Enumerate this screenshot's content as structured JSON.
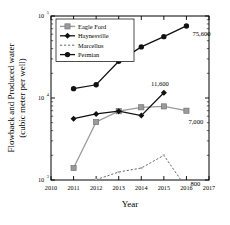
{
  "chart_data": {
    "type": "line",
    "title": "",
    "xlabel": "Year",
    "ylabel": "Flowback and Produced water (cubic meter per well)",
    "ylabel_line1": "Flowback and Produced water",
    "ylabel_line2": "(cubic meter per well)",
    "yscale": "log",
    "ylim": [
      1000,
      100000
    ],
    "ytick_labels": [
      "10",
      "10",
      "10"
    ],
    "ytick_exponents": [
      "5",
      "4",
      "3"
    ],
    "ytick_values": [
      100000,
      10000,
      1000
    ],
    "xlim": [
      2010,
      2017
    ],
    "xtick_labels": [
      "2010",
      "2011",
      "2012",
      "2013",
      "2014",
      "2015",
      "2016",
      "2017"
    ],
    "grid": false,
    "legend_position": "top-left",
    "x": [
      2011,
      2012,
      2013,
      2014,
      2015,
      2016
    ],
    "series": [
      {
        "name": "Eagle Ford",
        "marker": "square",
        "color": "#9a9a9a",
        "line_style": "solid",
        "values": [
          1400,
          5100,
          6900,
          7700,
          7900,
          7000
        ],
        "end_label": "7,000"
      },
      {
        "name": "Haynesville",
        "marker": "diamond",
        "color": "#111111",
        "line_style": "solid",
        "values": [
          5600,
          6400,
          6900,
          6100,
          11600,
          null
        ],
        "end_label": "11,600"
      },
      {
        "name": "Marcellus",
        "marker": "none",
        "color": "#555555",
        "line_style": "dashed",
        "values": [
          800,
          1010,
          1250,
          1400,
          2000,
          800
        ],
        "end_label": "800"
      },
      {
        "name": "Permian",
        "marker": "circle",
        "color": "#111111",
        "line_style": "solid",
        "values": [
          13000,
          14500,
          28000,
          42000,
          56000,
          75600
        ],
        "end_label": "75,600"
      }
    ],
    "annotations": [
      {
        "text": "75,600",
        "series": "Permian",
        "x": 2016,
        "y": 75600
      },
      {
        "text": "11,600",
        "series": "Haynesville",
        "x": 2015,
        "y": 11600
      },
      {
        "text": "7,000",
        "series": "Eagle Ford",
        "x": 2016,
        "y": 7000
      },
      {
        "text": "800",
        "series": "Marcellus",
        "x": 2016,
        "y": 800
      }
    ]
  }
}
